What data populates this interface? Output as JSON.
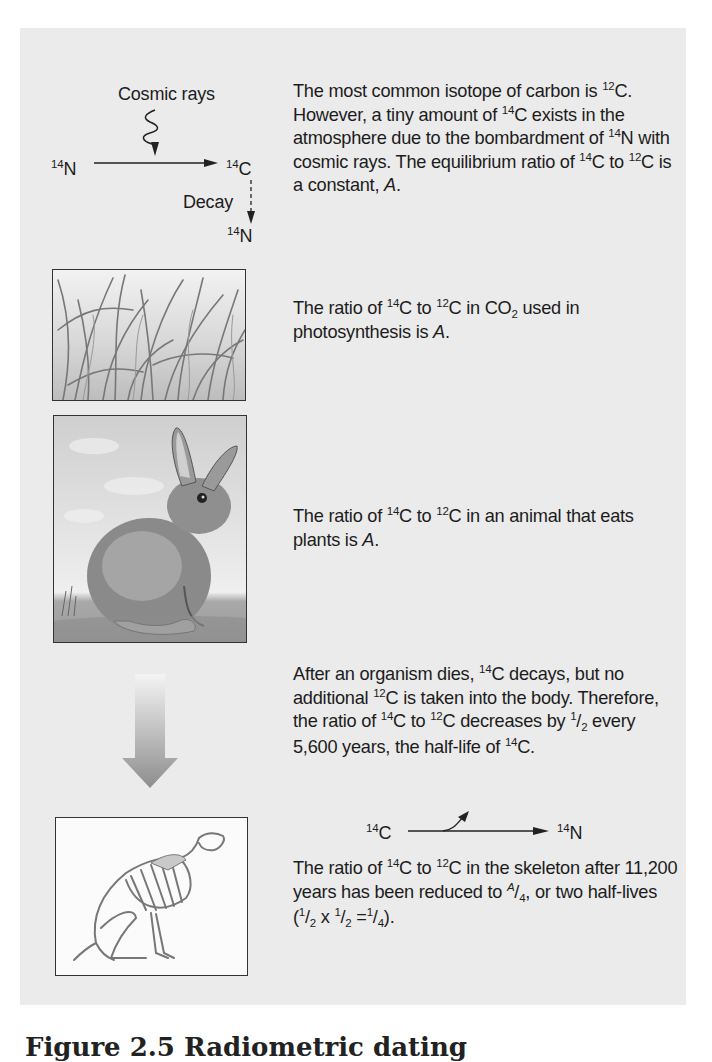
{
  "figure": {
    "caption": "Figure 2.5 Radiometric dating",
    "background_color": "#ebebeb"
  },
  "top_diagram": {
    "cosmic_rays_label": "Cosmic rays",
    "source": {
      "mass": "14",
      "symbol": "N"
    },
    "product": {
      "mass": "14",
      "symbol": "C"
    },
    "decay_label": "Decay",
    "decay_product": {
      "mass": "14",
      "symbol": "N"
    }
  },
  "sections": [
    {
      "id": "atmosphere",
      "text_parts": [
        "The most common isotope of carbon is ",
        "12",
        "C. However, a tiny amount of ",
        "14",
        "C exists in the atmosphere due to the bombardment of ",
        "14",
        "N with cosmic rays. The equilibrium ratio of ",
        "14",
        "C to ",
        "12",
        "C is a constant, ",
        "A",
        "."
      ]
    },
    {
      "id": "photosynthesis",
      "image": "grass-illustration",
      "text_parts": [
        "The ratio of ",
        "14",
        "C to ",
        "12",
        "C in CO",
        "2",
        " used in photosynthesis is ",
        "A",
        "."
      ]
    },
    {
      "id": "animal",
      "image": "rabbit-illustration",
      "text_parts": [
        "The ratio of ",
        "14",
        "C to ",
        "12",
        "C in an animal that eats plants is ",
        "A",
        "."
      ]
    },
    {
      "id": "death",
      "image": "down-arrow",
      "text_parts": [
        "After an organism dies, ",
        "14",
        "C decays, but no additional ",
        "12",
        "C is taken into the body. Therefore, the ratio of ",
        "14",
        "C to ",
        "12",
        "C decreases by ",
        "1",
        "/",
        "2",
        " every 5,600 years, the half-life of ",
        "14",
        "C."
      ]
    },
    {
      "id": "skeleton",
      "image": "skeleton-illustration",
      "reaction": {
        "from": {
          "mass": "14",
          "symbol": "C"
        },
        "to": {
          "mass": "14",
          "symbol": "N"
        }
      },
      "text_parts": [
        "The ratio of ",
        "14",
        "C to ",
        "12",
        "C in the skeleton after 11,200 years has been reduced to ",
        "A",
        "/",
        "4",
        ", or two half-lives (",
        "1",
        "/",
        "2",
        " x ",
        "1",
        "/",
        "2",
        " =",
        "1",
        "/",
        "4",
        ")."
      ]
    }
  ]
}
